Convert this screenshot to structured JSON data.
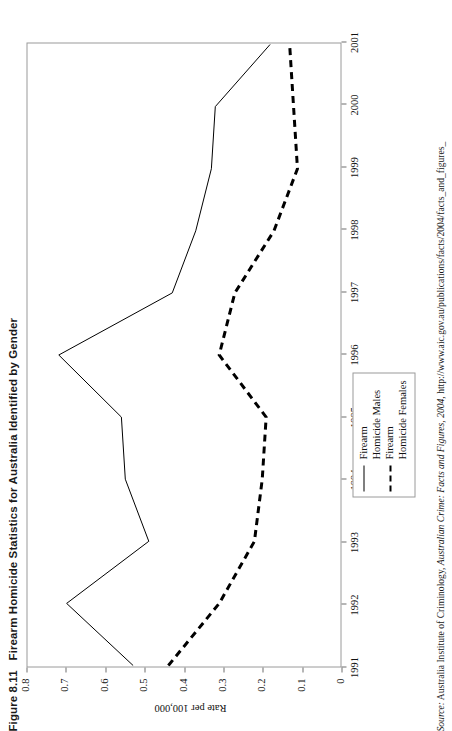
{
  "figure": {
    "number": "Figure 8.11",
    "title": "Firearm Homicide Statistics for Australia Identified by Gender",
    "source_prefix": "Source:",
    "source_body": "Australia Institute of Criminology, ",
    "source_italic": "Australian Crime: Facts and Figures, 2004",
    "source_tail": ", http://www.aic.gov.au/publications/facts/2004/facts_and_figures_"
  },
  "chart_data": {
    "type": "line",
    "title": "Firearm Homicide Statistics for Australia Identified by Gender",
    "xlabel": "",
    "ylabel": "Rate per 100,000",
    "categories": [
      "1991",
      "1992",
      "1993",
      "1994",
      "1995",
      "1996",
      "1997",
      "1998",
      "1999",
      "2000",
      "2001"
    ],
    "x": [
      1991,
      1992,
      1993,
      1994,
      1995,
      1996,
      1997,
      1998,
      1999,
      2000,
      2001
    ],
    "ylim": [
      0,
      0.8
    ],
    "yticks": [
      "0.8",
      "0.7",
      "0.6",
      "0.5",
      "0.4",
      "0.3",
      "0.2",
      "0.1",
      "0"
    ],
    "ytick_values": [
      0.8,
      0.7,
      0.6,
      0.5,
      0.4,
      0.3,
      0.2,
      0.1,
      0
    ],
    "grid": false,
    "legend_position": "bottom-right-inside",
    "series": [
      {
        "name": "Firearm Homicide Males",
        "style": "solid",
        "color": "#000000",
        "values": [
          0.53,
          0.7,
          0.49,
          0.55,
          0.56,
          0.72,
          0.43,
          0.37,
          0.33,
          0.32,
          0.18
        ]
      },
      {
        "name": "Firearm Homicide Females",
        "style": "dashed",
        "color": "#000000",
        "values": [
          0.44,
          0.31,
          0.22,
          0.2,
          0.19,
          0.31,
          0.27,
          0.17,
          0.11,
          0.12,
          0.13
        ]
      }
    ]
  },
  "legend": {
    "entries": [
      {
        "label_line1": "Firearm",
        "label_line2": "Homicide Males",
        "style": "solid"
      },
      {
        "label_line1": "Firearm",
        "label_line2": "Homicide Females",
        "style": "dashed"
      }
    ]
  }
}
